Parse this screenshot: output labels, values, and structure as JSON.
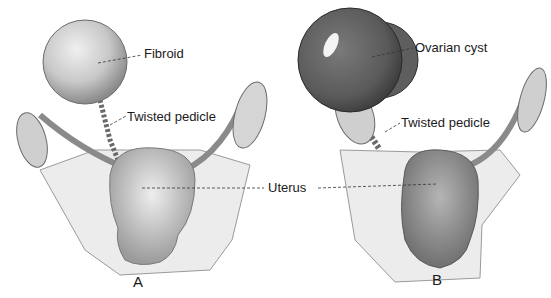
{
  "figure": {
    "panels": [
      {
        "id": "A",
        "label": "A",
        "annotations": {
          "mass": "Fibroid",
          "pedicle": "Twisted pedicle"
        }
      },
      {
        "id": "B",
        "label": "B",
        "annotations": {
          "mass": "Ovarian cyst",
          "pedicle": "Twisted pedicle"
        }
      }
    ],
    "shared_annotation": "Uterus"
  },
  "colors": {
    "background": "#ffffff",
    "ink": "#1a1a1a",
    "tissue_light": "#d9d9d9",
    "tissue_mid": "#a8a8a8",
    "tissue_dark": "#555555"
  }
}
